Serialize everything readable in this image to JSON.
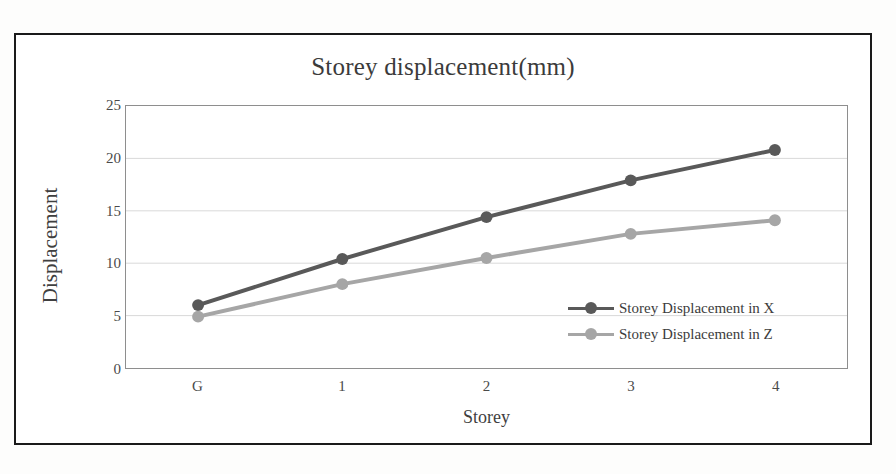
{
  "chart_data": {
    "type": "line",
    "title": "Storey displacement(mm)",
    "xlabel": "Storey",
    "ylabel": "Displacement",
    "categories": [
      "G",
      "1",
      "2",
      "3",
      "4"
    ],
    "series": [
      {
        "name": "Storey Displacement in X",
        "color": "#595959",
        "values": [
          6.0,
          10.4,
          14.4,
          17.9,
          20.8
        ]
      },
      {
        "name": "Storey Displacement in Z",
        "color": "#a6a6a6",
        "values": [
          4.9,
          8.0,
          10.5,
          12.8,
          14.1
        ]
      }
    ],
    "ylim": [
      0,
      25
    ],
    "ytick_values": [
      0,
      5,
      10,
      15,
      20,
      25
    ],
    "ytick_labels": [
      "0",
      "5",
      "10",
      "15",
      "20",
      "25"
    ],
    "grid": "horizontal",
    "legend_position": "inside-lower-right",
    "marker": "circle",
    "plot_border_color": "#8e8e8e",
    "gridline_color": "#d9d9d9",
    "frame_color": "#1a1a1a"
  },
  "legend": {
    "entries": [
      {
        "label": "Storey Displacement in X"
      },
      {
        "label": "Storey Displacement in Z"
      }
    ]
  }
}
